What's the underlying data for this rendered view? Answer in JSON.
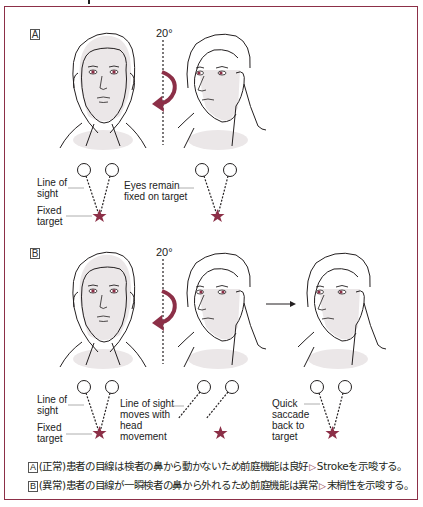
{
  "colors": {
    "accent": "#8c2f47",
    "border": "#8c2f47",
    "skin_shade": "#ebe7e8",
    "line": "#231f20"
  },
  "panel_a": {
    "label": "A",
    "angle": "20°",
    "annotations": {
      "line_of_sight": "Line of\nsight",
      "fixed_target": "Fixed\ntarget",
      "eyes_remain": "Eyes remain\nfixed on target"
    },
    "icons": [
      "face-front-icon",
      "rotate-arrow-icon",
      "face-turned-icon",
      "eye-circle-icon",
      "target-star-icon"
    ]
  },
  "panel_b": {
    "label": "B",
    "angle": "20°",
    "annotations": {
      "line_of_sight": "Line of\nsight",
      "fixed_target": "Fixed\ntarget",
      "moves_with_head": "Line of sight\nmoves with\nhead\nmovement",
      "quick_saccade": "Quick\nsaccade\nback to\ntarget"
    },
    "icons": [
      "face-front-icon",
      "rotate-arrow-icon",
      "face-turned-icon",
      "right-arrow-icon",
      "face-corrected-icon"
    ]
  },
  "captions": [
    {
      "tag": "A",
      "text_before": "(正常)患者の目線は検者の鼻から動かないため前庭機能は良好",
      "arrow": "▷",
      "text_after": "Strokeを示唆する。"
    },
    {
      "tag": "B",
      "text_before": "(異常)患者の目線が一瞬検者の鼻から外れるため前庭機能は異常",
      "arrow": "▷",
      "text_after": "末梢性を示唆する。"
    }
  ]
}
